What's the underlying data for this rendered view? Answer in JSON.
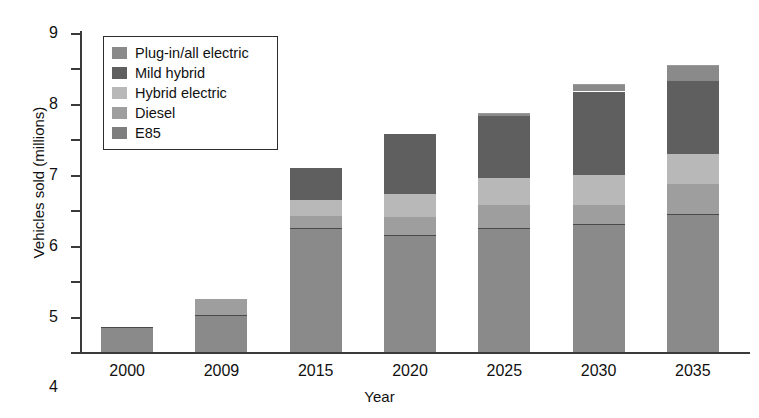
{
  "chart_data": {
    "type": "bar",
    "stacked": true,
    "title": "",
    "xlabel": "Year",
    "ylabel": "Vehicles sold (millions)",
    "categories": [
      "2000",
      "2009",
      "2015",
      "2020",
      "2025",
      "2030",
      "2035"
    ],
    "ylim": [
      0,
      9
    ],
    "yticks": [
      "0",
      "1",
      "2",
      "3",
      "4",
      "5",
      "6",
      "7",
      "8",
      "9"
    ],
    "grid": false,
    "legend_position": "upper-left-inside",
    "series": [
      {
        "name": "E85",
        "color": "#8a8a8a",
        "values": [
          0.7,
          1.05,
          3.5,
          3.3,
          3.5,
          3.6,
          3.9
        ]
      },
      {
        "name": "Diesel",
        "color": "#9e9e9e",
        "values": [
          0,
          0.45,
          0.35,
          0.5,
          0.65,
          0.55,
          0.85
        ]
      },
      {
        "name": "Hybrid electric",
        "color": "#b8b8b8",
        "values": [
          0,
          0,
          0.45,
          0.65,
          0.75,
          0.85,
          0.85
        ]
      },
      {
        "name": "Mild hybrid",
        "color": "#5f5f5f",
        "values": [
          0,
          0,
          0.9,
          1.7,
          1.75,
          2.35,
          2.05
        ]
      },
      {
        "name": "Plug-in/all electric",
        "color": "#8a8a8a",
        "values": [
          0,
          0,
          0,
          0,
          0.1,
          0.2,
          0.45
        ]
      }
    ],
    "totals": [
      0.7,
      1.5,
      5.2,
      6.15,
      6.75,
      7.35,
      8.1
    ]
  },
  "legend": {
    "items": [
      {
        "label": "Plug-in/all electric",
        "color": "#8a8a8a"
      },
      {
        "label": "Mild hybrid",
        "color": "#5f5f5f"
      },
      {
        "label": "Hybrid electric",
        "color": "#b8b8b8"
      },
      {
        "label": "Diesel",
        "color": "#9e9e9e"
      },
      {
        "label": "E85",
        "color": "#7e7e7e"
      }
    ]
  },
  "axes": {
    "y_title": "Vehicles sold (millions)",
    "x_title": "Year"
  }
}
